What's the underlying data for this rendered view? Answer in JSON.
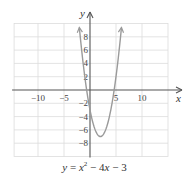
{
  "chart_data": {
    "type": "line",
    "title": "",
    "caption": {
      "lhs": "y",
      "eq": " = ",
      "x": "x",
      "sup": "2",
      "rest_a": " − 4",
      "x2": "x",
      "rest_b": " − 3"
    },
    "function": "y = x^2 - 4x - 3",
    "xlabel": "x",
    "ylabel": "y",
    "xlim": [
      -14.6,
      15
    ],
    "ylim": [
      -10,
      10
    ],
    "grid": true,
    "x_ticks": [
      -10,
      -5,
      5,
      10
    ],
    "x_tick_labels": [
      "−10",
      "−5",
      "5",
      "10"
    ],
    "y_ticks": [
      8,
      6,
      4,
      2,
      -2,
      -4,
      -6,
      -8
    ],
    "y_tick_labels": [
      "8",
      "6",
      "4",
      "2",
      "−2",
      "−4",
      "−6",
      "−8"
    ],
    "x_grid_step": 5,
    "y_grid_step": 2,
    "series": [
      {
        "name": "y = x^2 - 4x - 3",
        "domain": [
          -2.0,
          6.0
        ],
        "vertex": [
          2,
          -7
        ],
        "x": [
          -2,
          -1,
          0,
          1,
          2,
          3,
          4,
          5,
          6
        ],
        "y": [
          9,
          2,
          -3,
          -6,
          -7,
          -6,
          -3,
          2,
          9
        ],
        "arrows_at_ends": true
      }
    ],
    "colors": {
      "curve": "#9a9a9a",
      "axis": "#555555",
      "grid": "#dcdcdc"
    }
  }
}
